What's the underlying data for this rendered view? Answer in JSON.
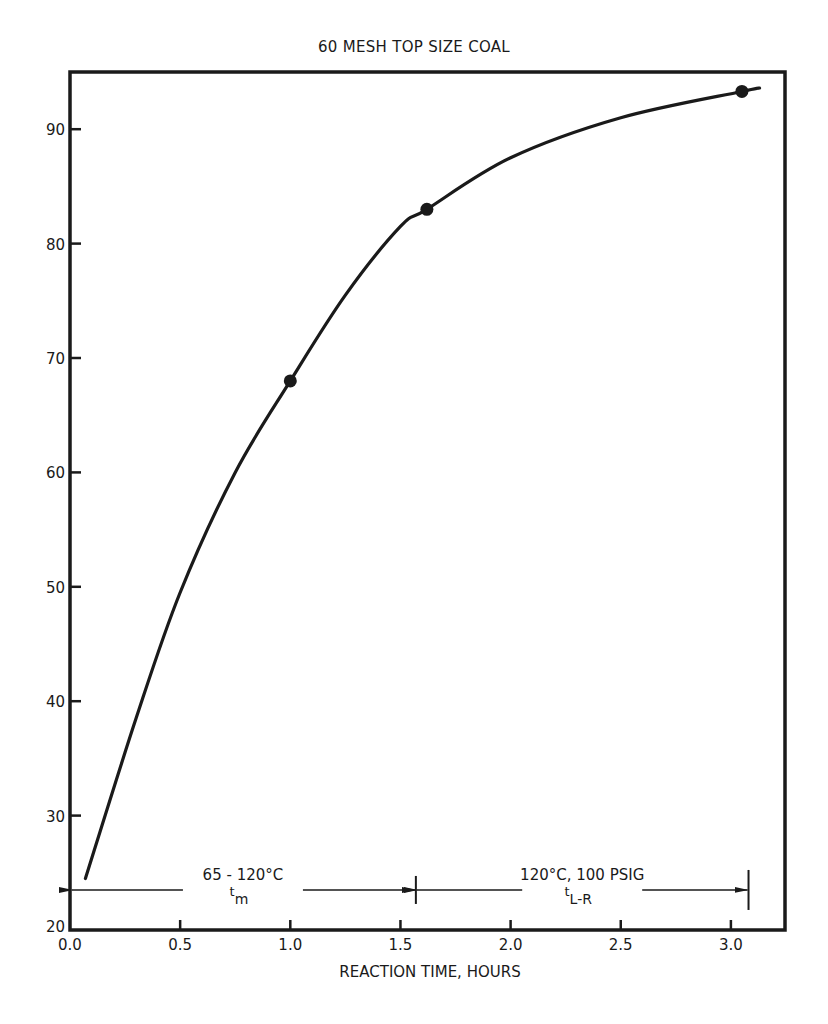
{
  "chart_data": {
    "type": "line",
    "title": "60 MESH TOP SIZE COAL",
    "xlabel": "REACTION TIME, HOURS",
    "ylabel": "",
    "xlim": [
      0.0,
      3.2
    ],
    "ylim": [
      20,
      95
    ],
    "x_ticks": [
      "0.0",
      "0.5",
      "1.0",
      "1.5",
      "2.0",
      "2.5",
      "3.0"
    ],
    "x_tick_values": [
      0.0,
      0.5,
      1.0,
      1.5,
      2.0,
      2.5,
      3.0
    ],
    "y_ticks": [
      "20",
      "30",
      "40",
      "50",
      "60",
      "70",
      "80",
      "90"
    ],
    "y_tick_values": [
      20,
      30,
      40,
      50,
      60,
      70,
      80,
      90
    ],
    "grid": false,
    "legend": null,
    "series": [
      {
        "name": "curve",
        "style": "smooth line",
        "x": [
          0.07,
          0.3,
          0.5,
          0.75,
          1.0,
          1.25,
          1.5,
          1.62,
          2.0,
          2.5,
          3.05,
          3.13
        ],
        "values": [
          24.5,
          38.5,
          49.5,
          60.0,
          68.0,
          75.5,
          81.5,
          83.0,
          87.5,
          91.0,
          93.3,
          93.6
        ]
      },
      {
        "name": "data points",
        "style": "markers",
        "x": [
          1.0,
          1.62,
          3.05
        ],
        "values": [
          68.0,
          83.0,
          93.3
        ]
      }
    ],
    "annotations": [
      {
        "label": "65 - 120°C",
        "sublabel_main": "t",
        "sublabel_sub": "m",
        "x_start": 0.0,
        "x_end": 1.57,
        "y": 23.5,
        "type": "double-arrow range"
      },
      {
        "label": "120°C, 100 PSIG",
        "sublabel_main": "t",
        "sublabel_sub": "L-R",
        "x_start": 1.57,
        "x_end": 3.08,
        "y": 23.5,
        "type": "double-arrow range"
      }
    ]
  },
  "colors": {
    "ink": "#1a1a1a",
    "background": "#ffffff"
  }
}
